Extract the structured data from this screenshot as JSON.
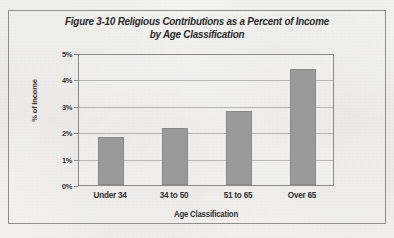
{
  "figure": {
    "title_line1": "Figure 3-10 Religious Contributions as a Percent of Income",
    "title_line2": "by Age Classification"
  },
  "chart_data": {
    "type": "bar",
    "title": "Figure 3-10 Religious Contributions as a Percent of Income by Age Classification",
    "categories": [
      "Under 34",
      "34 to 50",
      "51 to 65",
      "Over 65"
    ],
    "values": [
      1.8,
      2.15,
      2.8,
      4.4
    ],
    "xlabel": "Age Classification",
    "ylabel": "% of Income",
    "ylim": [
      0,
      5
    ],
    "ytick_labels": [
      "5%",
      "4%",
      "3%",
      "2%",
      "1%",
      "0%"
    ],
    "ytick_values": [
      5,
      4,
      3,
      2,
      1,
      0
    ],
    "grid": true,
    "legend": false,
    "bar_color": "#9b9b9b",
    "frame_color": "#8b8b8b",
    "gridline_color": "#b6b6b6"
  }
}
